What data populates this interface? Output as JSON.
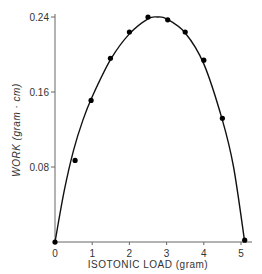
{
  "chart_data": {
    "type": "scatter",
    "title": "",
    "xlabel": "ISOTONIC LOAD (gram)",
    "ylabel": "WORK (gram · cm)",
    "xlim": [
      0,
      5.3
    ],
    "ylim": [
      0,
      0.25
    ],
    "grid": false,
    "legend": null,
    "x_ticks": [
      "0",
      "1",
      "2",
      "3",
      "4",
      "5"
    ],
    "y_ticks": [
      "0.08",
      "0.16",
      "0.24"
    ],
    "series": [
      {
        "name": "measured",
        "style": "points",
        "x": [
          0,
          0.54,
          0.97,
          1.49,
          2.0,
          2.5,
          3.03,
          3.5,
          4.0,
          4.5,
          5.1
        ],
        "y": [
          0,
          0.087,
          0.151,
          0.196,
          0.224,
          0.24,
          0.237,
          0.224,
          0.194,
          0.132,
          0.002
        ]
      },
      {
        "name": "fitted curve",
        "style": "line",
        "x": [
          0,
          0.25,
          0.5,
          0.75,
          1.0,
          1.5,
          2.0,
          2.5,
          2.75,
          3.0,
          3.5,
          4.0,
          4.5,
          4.8,
          5.1
        ],
        "y": [
          0,
          0.055,
          0.098,
          0.13,
          0.155,
          0.195,
          0.222,
          0.238,
          0.24,
          0.238,
          0.223,
          0.19,
          0.13,
          0.08,
          0.0
        ]
      }
    ]
  },
  "axes": {
    "x_title": "ISOTONIC LOAD (gram)",
    "y_title": "WORK  (gram · cm)"
  }
}
